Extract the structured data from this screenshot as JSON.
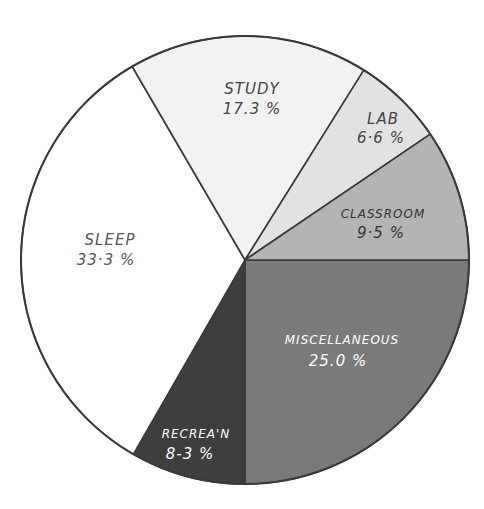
{
  "chart_data": {
    "type": "pie",
    "title": "",
    "center": [
      245,
      260
    ],
    "radius": 224,
    "start_angle_deg": 0,
    "direction": "clockwise",
    "slices": [
      {
        "label": "Miscellaneous",
        "display_label": "MISCELLANEOUS",
        "value": 25.0,
        "value_text": "25.0 %",
        "color": "#7a7a7a",
        "text_color": "#ffffff"
      },
      {
        "label": "Recrea'n",
        "display_label": "RECREA'N",
        "value": 8.3,
        "value_text": "8·3 %",
        "color": "#3e3e3e",
        "text_color": "#ffffff"
      },
      {
        "label": "Sleep",
        "display_label": "SLEEP",
        "value": 33.3,
        "value_text": "33·3 %",
        "color": "#ffffff",
        "text_color": "#555555"
      },
      {
        "label": "Study",
        "display_label": "STUDY",
        "value": 17.3,
        "value_text": "17.3 %",
        "color": "#f2f2f2",
        "text_color": "#444444"
      },
      {
        "label": "Lab",
        "display_label": "LAB",
        "value": 6.6,
        "value_text": "6·6 %",
        "color": "#e2e2e2",
        "text_color": "#444444"
      },
      {
        "label": "Classroom",
        "display_label": "CLASSROOM",
        "value": 9.5,
        "value_text": "9·5 %",
        "color": "#b4b4b4",
        "text_color": "#333333"
      }
    ],
    "legend": "none",
    "labels_inside_slices": true
  },
  "labels": {
    "misc": {
      "name": "MISCELLANEOUS",
      "pct": "25.0 %"
    },
    "recreation": {
      "name": "RECREA'N",
      "pct": "8-3 %"
    },
    "sleep": {
      "name": "SLEEP",
      "pct": "33·3 %"
    },
    "study": {
      "name": "STUDY",
      "pct": "17.3 %"
    },
    "lab": {
      "name": "LAB",
      "pct": "6·6 %"
    },
    "classroom": {
      "name": "CLASSROOM",
      "pct": "9·5 %"
    }
  }
}
